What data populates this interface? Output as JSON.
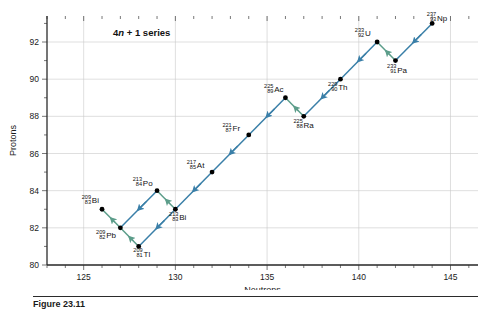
{
  "figure": {
    "annotation": "4n + 1 series",
    "annotation_prefix": "4",
    "annotation_italic": "n",
    "annotation_suffix": " + 1 series",
    "caption": "Figure 23.11"
  },
  "colors": {
    "alpha_arrow": "#3a7fa8",
    "beta_arrow": "#5c9d8a",
    "point": "#000000",
    "grid": "#c9c9c9",
    "axis": "#2b2b2b",
    "background": "#ffffff"
  },
  "chart_data": {
    "type": "scatter",
    "title": "4n + 1 series",
    "xlabel": "Neutrons",
    "ylabel": "Protons",
    "xlim": [
      123,
      146.5
    ],
    "ylim": [
      80,
      93.4
    ],
    "grid": true,
    "legend": "none",
    "xticks_major": [
      125,
      130,
      135,
      140,
      145
    ],
    "xticks_minor_step": 1,
    "yticks_major": [
      80,
      82,
      84,
      86,
      88,
      90,
      92
    ],
    "yticks_minor_step": 1,
    "x": [
      126,
      127,
      128,
      129,
      130,
      132,
      134,
      136,
      137,
      139,
      141,
      142,
      144
    ],
    "y": [
      83,
      82,
      81,
      84,
      83,
      85,
      87,
      89,
      88,
      90,
      92,
      91,
      93
    ],
    "points": [
      {
        "mass": "209",
        "z": "83",
        "el": "Bi",
        "n": 126,
        "p": 83,
        "lx": -11,
        "ly": -7,
        "anchor": "start"
      },
      {
        "mass": "209",
        "z": "82",
        "el": "Pb",
        "n": 127,
        "p": 82,
        "lx": -15,
        "ly": 9,
        "anchor": "start"
      },
      {
        "mass": "209",
        "z": "81",
        "el": "Tl",
        "n": 128,
        "p": 81,
        "lx": 4,
        "ly": 9,
        "anchor": "start"
      },
      {
        "mass": "213",
        "z": "84",
        "el": "Po",
        "n": 129,
        "p": 84,
        "lx": -15,
        "ly": -6,
        "anchor": "start"
      },
      {
        "mass": "213",
        "z": "83",
        "el": "Bi",
        "n": 130,
        "p": 83,
        "lx": 3,
        "ly": 10,
        "anchor": "start"
      },
      {
        "mass": "217",
        "z": "85",
        "el": "At",
        "n": 132,
        "p": 85,
        "lx": -16,
        "ly": -5,
        "anchor": "start"
      },
      {
        "mass": "221",
        "z": "87",
        "el": "Fr",
        "n": 134,
        "p": 87,
        "lx": -17,
        "ly": -5,
        "anchor": "start"
      },
      {
        "mass": "225",
        "z": "89",
        "el": "Ac",
        "n": 136,
        "p": 89,
        "lx": -12,
        "ly": -7,
        "anchor": "start"
      },
      {
        "mass": "225",
        "z": "88",
        "el": "Ra",
        "n": 137,
        "p": 88,
        "lx": -1,
        "ly": 10,
        "anchor": "start"
      },
      {
        "mass": "229",
        "z": "90",
        "el": "Th",
        "n": 139,
        "p": 90,
        "lx": -3,
        "ly": 10,
        "anchor": "start"
      },
      {
        "mass": "233",
        "z": "92",
        "el": "U",
        "n": 141,
        "p": 92,
        "lx": -13,
        "ly": -7,
        "anchor": "start"
      },
      {
        "mass": "233",
        "z": "91",
        "el": "Pa",
        "n": 142,
        "p": 91,
        "lx": 1,
        "ly": 11,
        "anchor": "start"
      },
      {
        "mass": "237",
        "z": "93",
        "el": "Np",
        "n": 144,
        "p": 93,
        "lx": 4,
        "ly": -4,
        "anchor": "start"
      }
    ],
    "decays": [
      {
        "from": [
          144,
          93
        ],
        "to": [
          142,
          91
        ],
        "kind": "alpha"
      },
      {
        "from": [
          142,
          91
        ],
        "to": [
          141,
          92
        ],
        "kind": "beta"
      },
      {
        "from": [
          141,
          92
        ],
        "to": [
          139,
          90
        ],
        "kind": "alpha"
      },
      {
        "from": [
          139,
          90
        ],
        "to": [
          137,
          88
        ],
        "kind": "alpha"
      },
      {
        "from": [
          137,
          88
        ],
        "to": [
          136,
          89
        ],
        "kind": "beta"
      },
      {
        "from": [
          136,
          89
        ],
        "to": [
          134,
          87
        ],
        "kind": "alpha"
      },
      {
        "from": [
          134,
          87
        ],
        "to": [
          132,
          85
        ],
        "kind": "alpha"
      },
      {
        "from": [
          132,
          85
        ],
        "to": [
          130,
          83
        ],
        "kind": "alpha"
      },
      {
        "from": [
          130,
          83
        ],
        "to": [
          129,
          84
        ],
        "kind": "beta"
      },
      {
        "from": [
          129,
          84
        ],
        "to": [
          127,
          82
        ],
        "kind": "alpha"
      },
      {
        "from": [
          127,
          82
        ],
        "to": [
          126,
          83
        ],
        "kind": "beta"
      },
      {
        "from": [
          130,
          83
        ],
        "to": [
          128,
          81
        ],
        "kind": "alpha"
      },
      {
        "from": [
          128,
          81
        ],
        "to": [
          127,
          82
        ],
        "kind": "beta"
      }
    ]
  }
}
